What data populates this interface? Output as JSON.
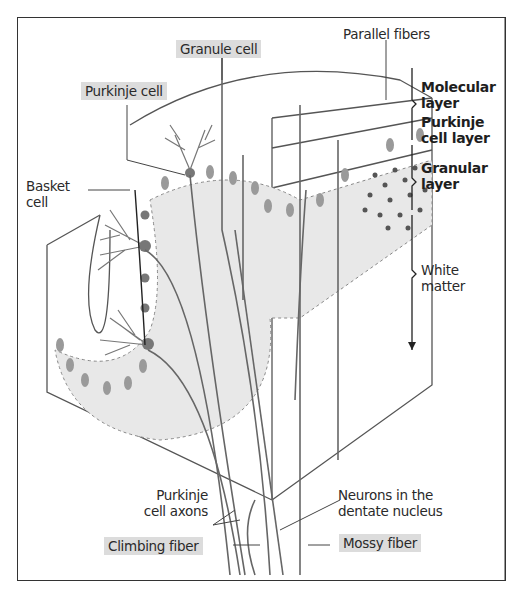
{
  "figure": {
    "type": "cerebellar cortex schematic",
    "labels": {
      "granule_cell": "Granule cell",
      "parallel_fibers": "Parallel fibers",
      "purkinje_cell": "Purkinje cell",
      "basket_cell_line1": "Basket",
      "basket_cell_line2": "cell",
      "purkinje_axons_line1": "Purkinje",
      "purkinje_axons_line2": "cell axons",
      "dentate_line1": "Neurons in the",
      "dentate_line2": "dentate nucleus",
      "climbing_fiber": "Climbing fiber",
      "mossy_fiber": "Mossy fiber"
    },
    "layers": {
      "molecular_line1": "Molecular",
      "molecular_line2": "layer",
      "purkinje_line1": "Purkinje",
      "purkinje_line2": "cell layer",
      "granular_line1": "Granular",
      "granular_line2": "layer",
      "white_line1": "White",
      "white_line2": "matter"
    },
    "colors": {
      "highlight": "#dcdcdc",
      "grey_layer": "#e6e6e6",
      "cell_body": "#8c8c8c",
      "line": "#555555"
    }
  }
}
